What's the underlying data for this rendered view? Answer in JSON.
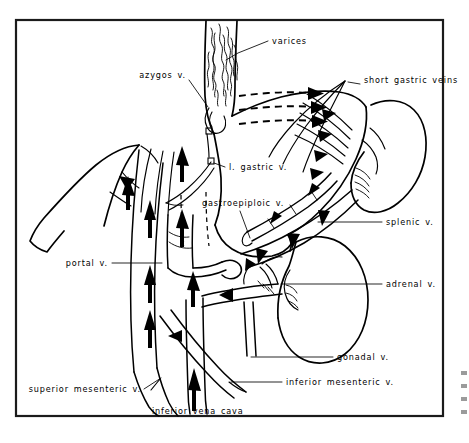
{
  "figure": {
    "domain": "medical-anatomical-illustration",
    "orientation": "anterior view of portal venous anatomy with liver, stomach, spleen and left kidney",
    "border": {
      "color": "#1b1b1b",
      "shown": true
    },
    "background_color": "#ffffff",
    "ink_color": "#000000"
  },
  "labels": [
    {
      "id": "varices",
      "text": "varices",
      "align": "start",
      "x": 272,
      "y": 44,
      "leader": "M 268 41 L 238 53 L 226 60",
      "describes": "esophageal varices - dilated submucosal veins of the lower esophagus"
    },
    {
      "id": "short-gastric-veins",
      "text": "short gastric veins",
      "align": "start",
      "x": 364,
      "y": 83,
      "leader": "",
      "describes": "vasa brevia connecting spleen to gastric fundus"
    },
    {
      "id": "azygos-v",
      "text": "azygos v.",
      "align": "end",
      "x": 186,
      "y": 78,
      "leader": "M 189 80 L 208 107",
      "describes": "azygos vein receiving esophageal collateral flow"
    },
    {
      "id": "l-gastric-v",
      "text": "l. gastric v.",
      "align": "start",
      "x": 229,
      "y": 170,
      "leader": "M 225 167 L 213 163",
      "describes": "left gastric (coronary) vein"
    },
    {
      "id": "gastroepiploic-v",
      "text": "gastroepiploic v.",
      "align": "start",
      "x": 202,
      "y": 206,
      "leader": "M 240 211 L 250 240",
      "describes": "gastroepiploic vein along the greater curvature"
    },
    {
      "id": "splenic-v",
      "text": "splenic v.",
      "align": "start",
      "x": 386,
      "y": 225,
      "leader": "M 382 222 L 318 222",
      "describes": "splenic vein draining the spleen into the portal vein"
    },
    {
      "id": "portal-v",
      "text": "portal v.",
      "align": "end",
      "x": 108,
      "y": 266,
      "leader": "M 112 263 L 163 263",
      "describes": "main portal vein trunk"
    },
    {
      "id": "adrenal-v",
      "text": "adrenal v.",
      "align": "start",
      "x": 386,
      "y": 287,
      "leader": "M 382 284 L 278 284",
      "describes": "left adrenal (suprarenal) vein"
    },
    {
      "id": "gonadal-v",
      "text": "gonadal v.",
      "align": "start",
      "x": 337,
      "y": 360,
      "leader": "M 333 357 L 272 357",
      "describes": "left gonadal (testicular / ovarian) vein"
    },
    {
      "id": "inferior-mesenteric-v",
      "text": "inferior mesenteric v.",
      "align": "start",
      "x": 286,
      "y": 385,
      "leader": "M 282 382 L 229 382",
      "describes": "inferior mesenteric vein"
    },
    {
      "id": "superior-mesenteric-v",
      "text": "superior mesenteric v.",
      "align": "end",
      "x": 141,
      "y": 392,
      "leader": "M 144 389 L 160 379",
      "describes": "superior mesenteric vein"
    },
    {
      "id": "inferior-vena-cava",
      "text": "inferior vena cava",
      "align": "start",
      "x": 152,
      "y": 414,
      "leader": "M 194 410 L 194 392",
      "describes": "inferior vena cava receiving systemic venous return"
    }
  ],
  "anatomy": {
    "organs": [
      {
        "id": "liver",
        "name": "liver",
        "note": "left lobe margin sweeping to upper left"
      },
      {
        "id": "stomach",
        "name": "stomach",
        "note": "body and fundus, greater curvature to the right"
      },
      {
        "id": "esophagus",
        "name": "esophagus",
        "note": "vertical tube at top bearing varices"
      },
      {
        "id": "spleen",
        "name": "spleen",
        "note": "upper right, with hilar vessels"
      },
      {
        "id": "left-kidney",
        "name": "left kidney",
        "note": "lower right, with hilum"
      }
    ],
    "flow_indicators": {
      "solid_arrow_count": 24,
      "dashed_flow_paths": 3,
      "meaning": "solid arrows show direction of venous blood flow; dashed arrows show hepatofugal collateral flow toward esophageal varices"
    }
  }
}
